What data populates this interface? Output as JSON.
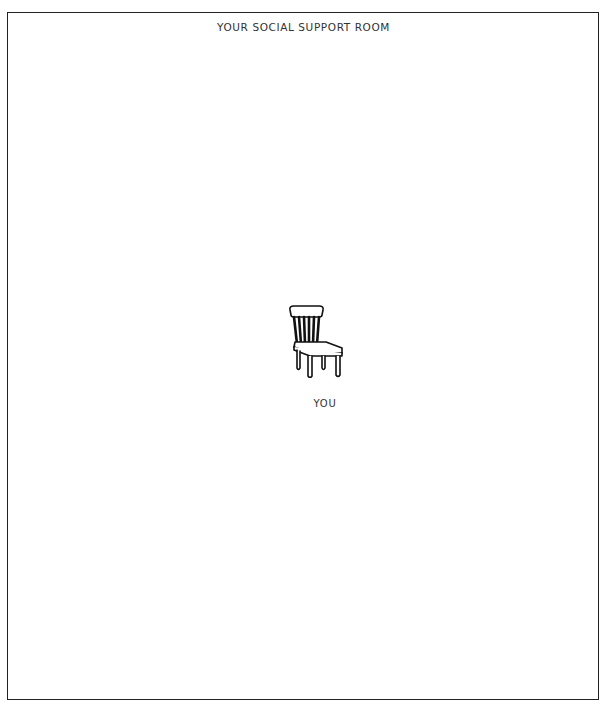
{
  "room": {
    "title": "YOUR SOCIAL SUPPORT ROOM"
  },
  "center_seat": {
    "icon": "chair-icon",
    "label": "YOU"
  },
  "colors": {
    "background": "#ffffff",
    "border": "#222222",
    "text": "#333333"
  }
}
